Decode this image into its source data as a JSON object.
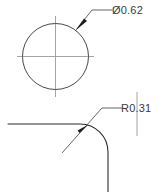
{
  "drawing": {
    "title": "CAD dimension detail view",
    "background_color": "#ffffff",
    "line_color": "#2b2b2b",
    "centerline_color": "#9a9a9a",
    "text_color": "#3a3a3a",
    "annotations": [
      {
        "id": "diameter-callout",
        "label": "Ø0.62",
        "type": "diameter",
        "value": 0.62,
        "symbol": "diameter-symbol",
        "target": "circle"
      },
      {
        "id": "radius-callout",
        "label": "R0.31",
        "type": "radius",
        "value": 0.31,
        "symbol": "radius-symbol",
        "target": "fillet-arc"
      }
    ],
    "features": [
      {
        "id": "circle",
        "name": "hole-circle",
        "center_x": 55.5,
        "center_y": 56.5,
        "radius": 33
      },
      {
        "id": "fillet-arc",
        "name": "corner-fillet-arc",
        "radius": 28,
        "start_x": 80,
        "start_y": 124,
        "end_x": 108,
        "end_y": 152
      }
    ]
  }
}
